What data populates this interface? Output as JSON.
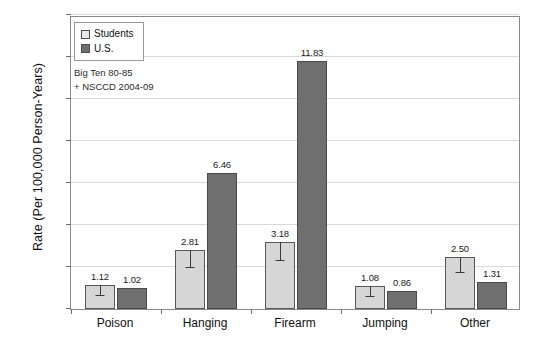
{
  "chart_data": {
    "type": "bar",
    "title": "",
    "xlabel": "",
    "ylabel": "Rate (Per 100,000 Person-Years)",
    "ylim": [
      0,
      14
    ],
    "yticks": [
      0,
      2,
      4,
      6,
      8,
      10,
      12,
      14
    ],
    "grid": true,
    "legend_position": "top-left",
    "categories": [
      "Poison",
      "Hanging",
      "Firearm",
      "Jumping",
      "Other"
    ],
    "series": [
      {
        "name": "Students",
        "color": "#d6d6d6",
        "values": [
          1.12,
          2.81,
          3.18,
          1.08,
          2.5
        ],
        "labels": [
          "1.12",
          "2.81",
          "3.18",
          "1.08",
          "2.50"
        ],
        "error_low": [
          0.62,
          1.95,
          2.3,
          0.58,
          1.7
        ],
        "error_high": [
          1.12,
          2.81,
          3.18,
          1.08,
          2.5
        ]
      },
      {
        "name": "U.S.",
        "color": "#6f6f6f",
        "values": [
          1.02,
          6.46,
          11.83,
          0.86,
          1.31
        ],
        "labels": [
          "1.02",
          "6.46",
          "11.83",
          "0.86",
          "1.31"
        ]
      }
    ],
    "annotations": [
      "Big  Ten 80-85",
      "+ NSCCD 2004-09"
    ]
  },
  "legend": {
    "items": [
      {
        "label": "Students"
      },
      {
        "label": "U.S."
      }
    ]
  },
  "caption": ""
}
